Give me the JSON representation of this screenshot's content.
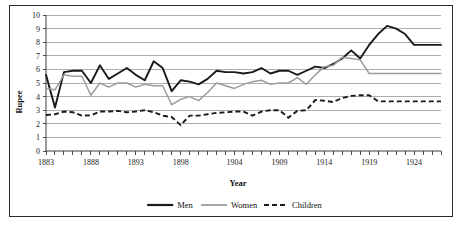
{
  "chart_data": {
    "type": "line",
    "title": "",
    "xlabel": "Year",
    "ylabel": "Rupee",
    "xlim": [
      1883,
      1927
    ],
    "ylim": [
      0,
      10
    ],
    "grid": true,
    "legend_position": "bottom",
    "ytick_labels": [
      "0",
      "1",
      "2",
      "3",
      "4",
      "5",
      "6",
      "7",
      "8",
      "9",
      "10"
    ],
    "yticks": [
      0,
      1,
      2,
      3,
      4,
      5,
      6,
      7,
      8,
      9,
      10
    ],
    "xtick_labels": [
      "1883",
      "1888",
      "1893",
      "1898",
      "1904",
      "1909",
      "1914",
      "1919",
      "1924"
    ],
    "xticks": [
      1883,
      1888,
      1893,
      1898,
      1904,
      1909,
      1914,
      1919,
      1924
    ],
    "x": [
      1883,
      1884,
      1885,
      1886,
      1887,
      1888,
      1889,
      1890,
      1891,
      1892,
      1893,
      1894,
      1895,
      1896,
      1897,
      1898,
      1899,
      1900,
      1901,
      1902,
      1903,
      1904,
      1905,
      1906,
      1907,
      1908,
      1909,
      1910,
      1911,
      1912,
      1913,
      1914,
      1915,
      1916,
      1917,
      1918,
      1919,
      1920,
      1921,
      1922,
      1923,
      1924,
      1925,
      1926,
      1927
    ],
    "series": [
      {
        "name": "Men",
        "color": "#1a1a1a",
        "style": "solid",
        "values": [
          5.6,
          3.2,
          5.8,
          5.9,
          5.9,
          5.0,
          6.3,
          5.3,
          5.7,
          6.1,
          5.6,
          5.2,
          6.6,
          6.1,
          4.4,
          5.2,
          5.1,
          4.9,
          5.3,
          5.9,
          5.8,
          5.8,
          5.7,
          5.8,
          6.1,
          5.7,
          5.9,
          5.9,
          5.6,
          5.9,
          6.2,
          6.1,
          6.4,
          6.8,
          7.4,
          6.8,
          7.8,
          8.6,
          9.2,
          9.0,
          8.6,
          7.8,
          7.8,
          7.8,
          7.8
        ]
      },
      {
        "name": "Women",
        "color": "#9c9c9c",
        "style": "solid",
        "values": [
          4.6,
          4.5,
          5.6,
          5.5,
          5.5,
          4.1,
          5.0,
          4.7,
          5.0,
          5.0,
          4.7,
          4.9,
          4.8,
          4.8,
          3.4,
          3.8,
          4.0,
          3.7,
          4.3,
          5.0,
          4.8,
          4.6,
          4.9,
          5.1,
          5.2,
          4.9,
          5.0,
          5.0,
          5.4,
          4.9,
          5.6,
          6.2,
          6.3,
          6.9,
          6.8,
          6.7,
          5.7,
          5.7,
          5.7,
          5.7,
          5.7,
          5.7,
          5.7,
          5.7,
          5.7
        ]
      },
      {
        "name": "Children",
        "color": "#1a1a1a",
        "style": "dashed",
        "values": [
          2.65,
          2.7,
          2.9,
          2.85,
          2.6,
          2.62,
          2.9,
          2.9,
          2.95,
          2.85,
          2.9,
          3.0,
          2.85,
          2.6,
          2.5,
          1.9,
          2.6,
          2.6,
          2.7,
          2.8,
          2.85,
          2.9,
          2.9,
          2.6,
          2.9,
          3.0,
          3.0,
          2.45,
          2.95,
          3.0,
          3.75,
          3.7,
          3.6,
          3.9,
          4.05,
          4.1,
          4.1,
          3.65,
          3.65,
          3.65,
          3.65,
          3.65,
          3.65,
          3.65,
          3.65
        ]
      }
    ]
  },
  "legend": {
    "items": [
      {
        "label": "Men"
      },
      {
        "label": "Women"
      },
      {
        "label": "Children"
      }
    ]
  }
}
